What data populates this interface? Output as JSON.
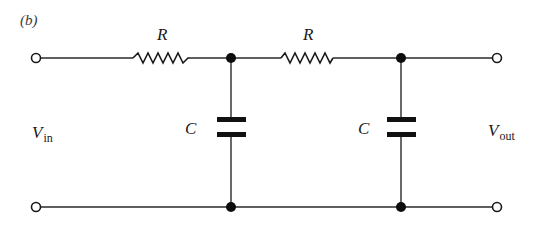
{
  "figure": {
    "panel_label": "(b)"
  },
  "components": {
    "resistor_1": {
      "label": "R"
    },
    "resistor_2": {
      "label": "R"
    },
    "capacitor_1": {
      "label": "C"
    },
    "capacitor_2": {
      "label": "C"
    }
  },
  "ports": {
    "input": {
      "symbol": "V",
      "subscript": "in"
    },
    "output": {
      "symbol": "V",
      "subscript": "out"
    }
  },
  "colors": {
    "ink": "#1a1a1a",
    "background": "#ffffff"
  }
}
